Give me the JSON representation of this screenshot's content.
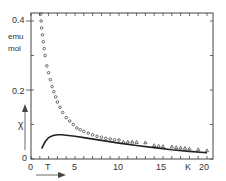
{
  "chart_data": {
    "type": "scatter",
    "title": "",
    "xlabel": "T  K",
    "ylabel": "χ  emu/mol",
    "xlim": [
      0,
      21
    ],
    "ylim": [
      0,
      0.42
    ],
    "xticks": [
      0,
      5,
      10,
      15,
      20
    ],
    "yticks": [
      0,
      0.2,
      0.4
    ],
    "x_unit": "K",
    "y_unit": "emu/mol",
    "grid": false,
    "series": [
      {
        "name": "circles (measured)",
        "marker": "circle",
        "x": [
          1.1,
          1.15,
          1.2,
          1.3,
          1.4,
          1.5,
          1.6,
          1.8,
          2.0,
          2.2,
          2.4,
          2.6,
          2.8,
          3.0,
          3.3,
          3.6,
          4.0,
          4.4,
          4.8,
          5.2,
          5.6,
          6.0,
          6.5,
          7.0,
          7.5,
          8.0,
          8.5,
          9.0,
          9.5,
          10.0
        ],
        "y": [
          0.42,
          0.4,
          0.38,
          0.36,
          0.34,
          0.32,
          0.3,
          0.27,
          0.25,
          0.23,
          0.21,
          0.195,
          0.18,
          0.165,
          0.15,
          0.135,
          0.12,
          0.11,
          0.1,
          0.09,
          0.085,
          0.08,
          0.075,
          0.07,
          0.066,
          0.063,
          0.06,
          0.058,
          0.056,
          0.055
        ]
      },
      {
        "name": "triangles (measured)",
        "marker": "triangle",
        "x": [
          10.5,
          11,
          11.5,
          12,
          13,
          14,
          14.5,
          15,
          16,
          16.5,
          17,
          17.5,
          18,
          19,
          20
        ],
        "y": [
          0.05,
          0.05,
          0.05,
          0.049,
          0.048,
          0.04,
          0.038,
          0.037,
          0.036,
          0.034,
          0.033,
          0.032,
          0.03,
          0.028,
          0.025
        ]
      },
      {
        "name": "solid curve",
        "marker": "line",
        "x": [
          1.2,
          1.6,
          2.0,
          2.5,
          3.0,
          3.5,
          4,
          5,
          6,
          8,
          10,
          12,
          14,
          16,
          18,
          20
        ],
        "y": [
          0.03,
          0.05,
          0.062,
          0.068,
          0.07,
          0.07,
          0.069,
          0.066,
          0.062,
          0.054,
          0.046,
          0.039,
          0.033,
          0.027,
          0.022,
          0.018
        ]
      }
    ],
    "annotations": [
      "T →",
      "χ ↑"
    ]
  },
  "labels": {
    "y04": "0.4",
    "y02": "0.2",
    "y0": "0",
    "emu": "emu",
    "mol": "mol",
    "chi": "χ",
    "x0": "0",
    "x5": "5",
    "x10": "10",
    "x15": "15",
    "xK": "K",
    "x20": "20",
    "xT": "T"
  }
}
